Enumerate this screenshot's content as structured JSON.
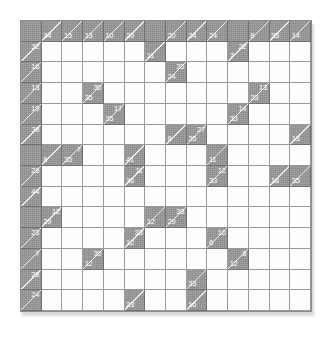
{
  "puzzle": {
    "name": "kakuro-grid",
    "type": "kakuro",
    "rows": 14,
    "cols": 14,
    "colors": {
      "block": "#8c8c8c",
      "open": "#fdfdfd",
      "line": "#9a9a9a",
      "clue_text": "#ffffff"
    },
    "cells": [
      [
        {
          "t": "b"
        },
        {
          "t": "c",
          "d": "34"
        },
        {
          "t": "c",
          "d": "15"
        },
        {
          "t": "c",
          "d": "13"
        },
        {
          "t": "c",
          "d": "10"
        },
        {
          "t": "c",
          "d": "29"
        },
        {
          "t": "b"
        },
        {
          "t": "c",
          "d": "20"
        },
        {
          "t": "c",
          "d": "24"
        },
        {
          "t": "c",
          "d": "24"
        },
        {
          "t": "b"
        },
        {
          "t": "c",
          "d": "8"
        },
        {
          "t": "c",
          "d": "35"
        },
        {
          "t": "c",
          "d": "14"
        }
      ],
      [
        {
          "t": "c",
          "a": "32"
        },
        {
          "t": "o"
        },
        {
          "t": "o"
        },
        {
          "t": "o"
        },
        {
          "t": "o"
        },
        {
          "t": "o"
        },
        {
          "t": "c",
          "d": "11"
        },
        {
          "t": "o"
        },
        {
          "t": "o"
        },
        {
          "t": "o"
        },
        {
          "t": "c",
          "a": "22",
          "d": "7"
        },
        {
          "t": "o"
        },
        {
          "t": "o"
        },
        {
          "t": "o"
        }
      ],
      [
        {
          "t": "c",
          "a": "16"
        },
        {
          "t": "o"
        },
        {
          "t": "o"
        },
        {
          "t": "o"
        },
        {
          "t": "o"
        },
        {
          "t": "o"
        },
        {
          "t": "o"
        },
        {
          "t": "c",
          "a": "35",
          "d": "24"
        },
        {
          "t": "o"
        },
        {
          "t": "o"
        },
        {
          "t": "o"
        },
        {
          "t": "o"
        },
        {
          "t": "o"
        },
        {
          "t": "o"
        }
      ],
      [
        {
          "t": "c",
          "a": "13"
        },
        {
          "t": "o"
        },
        {
          "t": "o"
        },
        {
          "t": "c",
          "a": "30",
          "d": "35"
        },
        {
          "t": "o"
        },
        {
          "t": "o"
        },
        {
          "t": "o"
        },
        {
          "t": "o"
        },
        {
          "t": "o"
        },
        {
          "t": "o"
        },
        {
          "t": "o"
        },
        {
          "t": "c",
          "a": "13",
          "d": "33"
        },
        {
          "t": "o"
        },
        {
          "t": "o"
        }
      ],
      [
        {
          "t": "c",
          "a": "19"
        },
        {
          "t": "o"
        },
        {
          "t": "o"
        },
        {
          "t": "o"
        },
        {
          "t": "c",
          "a": "17",
          "d": "35"
        },
        {
          "t": "o"
        },
        {
          "t": "o"
        },
        {
          "t": "o"
        },
        {
          "t": "o"
        },
        {
          "t": "o"
        },
        {
          "t": "c",
          "a": "14",
          "d": "33"
        },
        {
          "t": "o"
        },
        {
          "t": "o"
        },
        {
          "t": "o"
        }
      ],
      [
        {
          "t": "c",
          "a": "38"
        },
        {
          "t": "o"
        },
        {
          "t": "o"
        },
        {
          "t": "o"
        },
        {
          "t": "o"
        },
        {
          "t": "o"
        },
        {
          "t": "o"
        },
        {
          "t": "c",
          "d": "8"
        },
        {
          "t": "c",
          "a": "27",
          "d": "35"
        },
        {
          "t": "o"
        },
        {
          "t": "o"
        },
        {
          "t": "o"
        },
        {
          "t": "o"
        },
        {
          "t": "c",
          "d": "13"
        }
      ],
      [
        {
          "t": "b"
        },
        {
          "t": "c",
          "d": "8"
        },
        {
          "t": "c",
          "a": "7",
          "d": "35"
        },
        {
          "t": "o"
        },
        {
          "t": "o"
        },
        {
          "t": "c",
          "d": "41"
        },
        {
          "t": "o"
        },
        {
          "t": "o"
        },
        {
          "t": "o"
        },
        {
          "t": "c",
          "d": "11"
        },
        {
          "t": "o"
        },
        {
          "t": "o"
        },
        {
          "t": "o"
        },
        {
          "t": "o"
        }
      ],
      [
        {
          "t": "c",
          "a": "28"
        },
        {
          "t": "o"
        },
        {
          "t": "o"
        },
        {
          "t": "o"
        },
        {
          "t": "o"
        },
        {
          "t": "c",
          "a": "11",
          "d": "36"
        },
        {
          "t": "o"
        },
        {
          "t": "o"
        },
        {
          "t": "o"
        },
        {
          "t": "c",
          "a": "12",
          "d": "33"
        },
        {
          "t": "o"
        },
        {
          "t": "o"
        },
        {
          "t": "c",
          "d": "18"
        },
        {
          "t": "c",
          "d": "35"
        }
      ],
      [
        {
          "t": "c",
          "a": "44"
        },
        {
          "t": "o"
        },
        {
          "t": "o"
        },
        {
          "t": "o"
        },
        {
          "t": "o"
        },
        {
          "t": "o"
        },
        {
          "t": "o"
        },
        {
          "t": "o"
        },
        {
          "t": "o"
        },
        {
          "t": "o"
        },
        {
          "t": "o"
        },
        {
          "t": "o"
        },
        {
          "t": "o"
        },
        {
          "t": "o"
        }
      ],
      [
        {
          "t": "b"
        },
        {
          "t": "c",
          "a": "12",
          "d": "29"
        },
        {
          "t": "o"
        },
        {
          "t": "o"
        },
        {
          "t": "o"
        },
        {
          "t": "o"
        },
        {
          "t": "c",
          "d": "12"
        },
        {
          "t": "c",
          "a": "38",
          "d": "29"
        },
        {
          "t": "o"
        },
        {
          "t": "o"
        },
        {
          "t": "o"
        },
        {
          "t": "o"
        },
        {
          "t": "o"
        },
        {
          "t": "o"
        }
      ],
      [
        {
          "t": "c",
          "a": "23"
        },
        {
          "t": "o"
        },
        {
          "t": "o"
        },
        {
          "t": "o"
        },
        {
          "t": "o"
        },
        {
          "t": "c",
          "a": "33",
          "d": "12"
        },
        {
          "t": "o"
        },
        {
          "t": "o"
        },
        {
          "t": "o"
        },
        {
          "t": "c",
          "a": "10",
          "d": "6"
        },
        {
          "t": "o"
        },
        {
          "t": "o"
        },
        {
          "t": "o"
        },
        {
          "t": "o"
        }
      ],
      [
        {
          "t": "c",
          "a": "7"
        },
        {
          "t": "o"
        },
        {
          "t": "o"
        },
        {
          "t": "c",
          "a": "30",
          "d": "12"
        },
        {
          "t": "o"
        },
        {
          "t": "o"
        },
        {
          "t": "o"
        },
        {
          "t": "o"
        },
        {
          "t": "o"
        },
        {
          "t": "o"
        },
        {
          "t": "c",
          "a": "8",
          "d": "12"
        },
        {
          "t": "o"
        },
        {
          "t": "o"
        },
        {
          "t": "o"
        }
      ],
      [
        {
          "t": "c",
          "a": "28"
        },
        {
          "t": "o"
        },
        {
          "t": "o"
        },
        {
          "t": "o"
        },
        {
          "t": "o"
        },
        {
          "t": "o"
        },
        {
          "t": "o"
        },
        {
          "t": "o"
        },
        {
          "t": "c",
          "d": "33"
        },
        {
          "t": "o"
        },
        {
          "t": "o"
        },
        {
          "t": "o"
        },
        {
          "t": "o"
        },
        {
          "t": "o"
        }
      ],
      [
        {
          "t": "c",
          "a": "24"
        },
        {
          "t": "o"
        },
        {
          "t": "o"
        },
        {
          "t": "o"
        },
        {
          "t": "o"
        },
        {
          "t": "c",
          "d": "23"
        },
        {
          "t": "o"
        },
        {
          "t": "o"
        },
        {
          "t": "c",
          "d": "16"
        },
        {
          "t": "o"
        },
        {
          "t": "o"
        },
        {
          "t": "o"
        },
        {
          "t": "o"
        },
        {
          "t": "o"
        }
      ]
    ]
  }
}
